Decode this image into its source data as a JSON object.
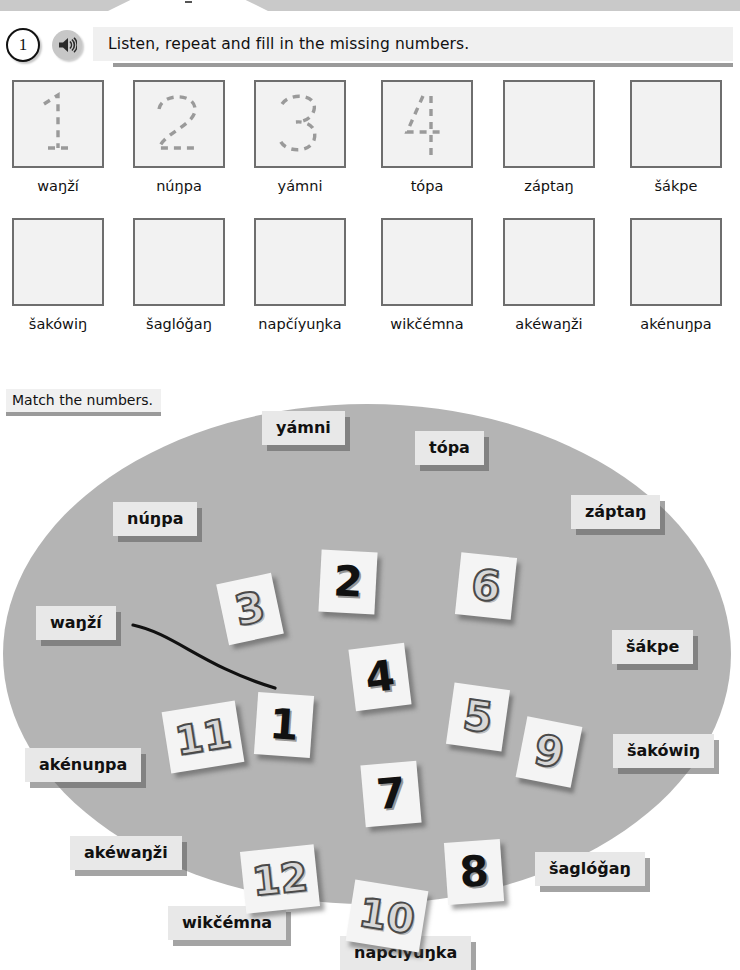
{
  "header": {
    "exercise_number": "1",
    "audio_icon": "speaker-icon",
    "instruction": "Listen, repeat and fill in the missing numbers."
  },
  "trace_exercise": {
    "rows": [
      [
        {
          "digit": "1",
          "traced": true,
          "label": "waŋží"
        },
        {
          "digit": "2",
          "traced": true,
          "label": "núŋpa"
        },
        {
          "digit": "3",
          "traced": true,
          "label": "yámni"
        },
        {
          "digit": "4",
          "traced": true,
          "label": "tópa"
        },
        {
          "digit": "",
          "traced": false,
          "label": "záptaŋ"
        },
        {
          "digit": "",
          "traced": false,
          "label": "šákpe"
        }
      ],
      [
        {
          "digit": "",
          "traced": false,
          "label": "šakówiŋ"
        },
        {
          "digit": "",
          "traced": false,
          "label": "šaglóǧaŋ"
        },
        {
          "digit": "",
          "traced": false,
          "label": "napčíyuŋka"
        },
        {
          "digit": "",
          "traced": false,
          "label": "wikčémna"
        },
        {
          "digit": "",
          "traced": false,
          "label": "akéwaŋži"
        },
        {
          "digit": "",
          "traced": false,
          "label": "akénuŋpa"
        }
      ]
    ]
  },
  "match_exercise": {
    "title": "Match the numbers.",
    "word_cards": [
      {
        "label": "yámni",
        "x": 262,
        "y": 13
      },
      {
        "label": "tópa",
        "x": 415,
        "y": 33
      },
      {
        "label": "núŋpa",
        "x": 113,
        "y": 104
      },
      {
        "label": "záptaŋ",
        "x": 571,
        "y": 97
      },
      {
        "label": "waŋží",
        "x": 36,
        "y": 208
      },
      {
        "label": "šákpe",
        "x": 612,
        "y": 232
      },
      {
        "label": "akénuŋpa",
        "x": 25,
        "y": 350
      },
      {
        "label": "šakówiŋ",
        "x": 613,
        "y": 336
      },
      {
        "label": "akéwaŋži",
        "x": 70,
        "y": 438
      },
      {
        "label": "šaglóǧaŋ",
        "x": 535,
        "y": 454
      },
      {
        "label": "wikčémna",
        "x": 168,
        "y": 508
      },
      {
        "label": "napčíyuŋka",
        "x": 340,
        "y": 538
      }
    ],
    "number_cards": [
      {
        "value": "3",
        "style": "outline",
        "x": 222,
        "y": 180,
        "rot": -12
      },
      {
        "value": "2",
        "style": "solid",
        "x": 320,
        "y": 153,
        "rot": 3
      },
      {
        "value": "6",
        "style": "outline",
        "x": 458,
        "y": 157,
        "rot": 6
      },
      {
        "value": "4",
        "style": "solid",
        "x": 352,
        "y": 248,
        "rot": -7
      },
      {
        "value": "5",
        "style": "outline",
        "x": 450,
        "y": 288,
        "rot": 8
      },
      {
        "value": "9",
        "style": "outline",
        "x": 521,
        "y": 323,
        "rot": 11
      },
      {
        "value": "11",
        "style": "outline",
        "x": 166,
        "y": 308,
        "rot": -9,
        "wide": true
      },
      {
        "value": "1",
        "style": "solid",
        "x": 256,
        "y": 296,
        "rot": 4
      },
      {
        "value": "7",
        "style": "solid",
        "x": 363,
        "y": 365,
        "rot": -5
      },
      {
        "value": "12",
        "style": "outline",
        "x": 243,
        "y": 450,
        "rot": -6,
        "wide": true
      },
      {
        "value": "10",
        "style": "outline",
        "x": 350,
        "y": 487,
        "rot": 9,
        "wide": true
      },
      {
        "value": "8",
        "style": "solid",
        "x": 446,
        "y": 443,
        "rot": -4
      }
    ],
    "connector": {
      "from_label": "waŋží",
      "to_number": "1",
      "path": "M 133 227 C 175 236, 202 268, 275 290"
    }
  },
  "colors": {
    "oval_gray": "#b4b4b4",
    "card_gray": "#e8e8e8",
    "box_fill": "#f2f2f2",
    "box_border": "#6e6e6e",
    "bar_gray": "#f0f0f0",
    "underline_gray": "#9a9a9a"
  }
}
